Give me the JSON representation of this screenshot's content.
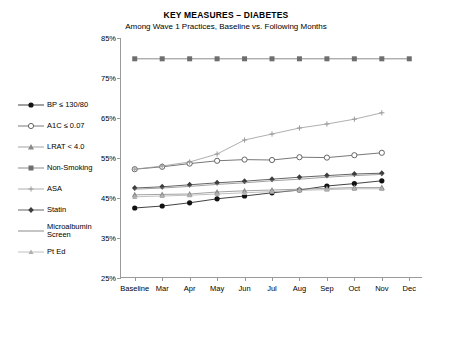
{
  "chart_data": {
    "type": "line",
    "title": "KEY MEASURES – DIABETES",
    "subtitle": "Among Wave 1 Practices, Baseline vs. Following Months",
    "xlabel": "",
    "ylabel": "",
    "ylim": [
      25,
      85
    ],
    "yticks": [
      "25%",
      "35%",
      "45%",
      "55%",
      "65%",
      "75%",
      "85%"
    ],
    "ytick_values": [
      25,
      35,
      45,
      55,
      65,
      75,
      85
    ],
    "categories": [
      "Baseline",
      "Mar",
      "Apr",
      "May",
      "Jun",
      "Jul",
      "Aug",
      "Sep",
      "Oct",
      "Nov",
      "Dec"
    ],
    "grid": false,
    "legend_position": "left-outside",
    "series": [
      {
        "name": "BP  ≤  130/80",
        "marker": "filled-circle",
        "color": "#111111",
        "values": [
          42.5,
          43.0,
          43.8,
          44.8,
          45.5,
          46.3,
          47.0,
          48.0,
          48.6,
          49.3,
          null
        ]
      },
      {
        "name": "A1C  ≤  0.07",
        "marker": "open-circle",
        "color": "#555555",
        "values": [
          52.2,
          52.8,
          53.6,
          54.3,
          54.6,
          54.5,
          55.2,
          55.1,
          55.7,
          56.3,
          null
        ]
      },
      {
        "name": "LRAT < 4.0",
        "marker": "filled-triangle",
        "color": "#8a8a8a",
        "values": [
          45.8,
          45.9,
          46.0,
          46.5,
          46.8,
          47.0,
          47.2,
          47.4,
          47.6,
          47.6,
          null
        ]
      },
      {
        "name": "Non-Smoking",
        "marker": "filled-square",
        "color": "#6e6e6e",
        "values": [
          79.8,
          79.8,
          79.8,
          79.8,
          79.8,
          79.8,
          79.8,
          79.8,
          79.8,
          79.8,
          79.8
        ]
      },
      {
        "name": "ASA",
        "marker": "plus",
        "color": "#9a9a9a",
        "values": [
          52.2,
          53.0,
          54.0,
          56.0,
          59.5,
          61.0,
          62.5,
          63.5,
          64.7,
          66.3,
          null
        ]
      },
      {
        "name": "Statin",
        "marker": "filled-diamond",
        "color": "#3d3d3d",
        "values": [
          47.5,
          47.8,
          48.3,
          48.8,
          49.2,
          49.7,
          50.2,
          50.6,
          51.0,
          51.2,
          null
        ]
      },
      {
        "name": "Microalbumin Screen",
        "marker": "line",
        "color": "#8a8a8a",
        "values": [
          47.2,
          47.5,
          47.9,
          48.4,
          48.8,
          49.3,
          49.7,
          50.2,
          50.6,
          50.9,
          null
        ]
      },
      {
        "name": "Pt Ed",
        "marker": "filled-triangle-small",
        "color": "#b0b0b0",
        "values": [
          45.3,
          45.5,
          45.7,
          46.0,
          46.3,
          46.6,
          46.9,
          47.1,
          47.3,
          47.3,
          null
        ]
      }
    ]
  },
  "legend": {
    "items": [
      {
        "label": "BP  ≤  130/80",
        "icon": "filled-circle-marker-icon"
      },
      {
        "label": "A1C  ≤  0.07",
        "icon": "open-circle-marker-icon"
      },
      {
        "label": "LRAT < 4.0",
        "icon": "filled-triangle-marker-icon"
      },
      {
        "label": "Non-Smoking",
        "icon": "filled-square-marker-icon"
      },
      {
        "label": "ASA",
        "icon": "plus-marker-icon"
      },
      {
        "label": "Statin",
        "icon": "filled-diamond-marker-icon"
      },
      {
        "label": "Microalbumin Screen",
        "icon": "line-marker-icon"
      },
      {
        "label": "Pt Ed",
        "icon": "small-triangle-marker-icon"
      }
    ]
  }
}
